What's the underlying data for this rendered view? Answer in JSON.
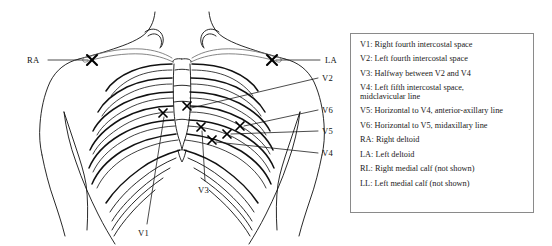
{
  "figure": {
    "kind": "anatomical-diagram",
    "torso": {
      "view": "anterior",
      "features": [
        "neck",
        "shoulders",
        "clavicles",
        "sternum",
        "rib-cage",
        "arms"
      ]
    },
    "electrode_markers": [
      {
        "id": "RA",
        "x": 92,
        "y": 60,
        "label": "RA"
      },
      {
        "id": "LA",
        "x": 272,
        "y": 60,
        "label": "LA"
      },
      {
        "id": "V1",
        "x": 163,
        "y": 113,
        "label": "V1"
      },
      {
        "id": "V2",
        "x": 187,
        "y": 106,
        "label": "V2"
      },
      {
        "id": "V3",
        "x": 201,
        "y": 127,
        "label": "V3"
      },
      {
        "id": "V4",
        "x": 212,
        "y": 140,
        "label": "V4"
      },
      {
        "id": "V5",
        "x": 227,
        "y": 134,
        "label": "V5"
      },
      {
        "id": "V6",
        "x": 240,
        "y": 126,
        "label": "V6"
      }
    ],
    "callouts": [
      {
        "id": "callout-RA",
        "text": "RA",
        "label_x": 27,
        "label_y": 55,
        "line": [
          [
            48,
            60
          ],
          [
            88,
            60
          ]
        ]
      },
      {
        "id": "callout-LA",
        "text": "LA",
        "label_x": 325,
        "label_y": 55,
        "line": [
          [
            276,
            60
          ],
          [
            320,
            60
          ]
        ]
      },
      {
        "id": "callout-V2",
        "text": "V2",
        "label_x": 322,
        "label_y": 73,
        "line": [
          [
            191,
            108
          ],
          [
            318,
            78
          ]
        ]
      },
      {
        "id": "callout-V6",
        "text": "V6",
        "label_x": 322,
        "label_y": 105,
        "line": [
          [
            244,
            126
          ],
          [
            318,
            110
          ]
        ]
      },
      {
        "id": "callout-V5",
        "text": "V5",
        "label_x": 322,
        "label_y": 126,
        "line": [
          [
            231,
            134
          ],
          [
            318,
            131
          ]
        ]
      },
      {
        "id": "callout-V4",
        "text": "V4",
        "label_x": 322,
        "label_y": 148,
        "line": [
          [
            216,
            142
          ],
          [
            318,
            153
          ]
        ]
      },
      {
        "id": "callout-V3",
        "text": "V3",
        "label_x": 198,
        "label_y": 185,
        "line": [
          [
            202,
            131
          ],
          [
            205,
            181
          ]
        ]
      },
      {
        "id": "callout-V1",
        "text": "V1",
        "label_x": 138,
        "label_y": 228,
        "line": [
          [
            164,
            117
          ],
          [
            147,
            224
          ]
        ]
      }
    ]
  },
  "legend": {
    "items": [
      "V1: Right fourth intercostal space",
      "V2: Left fourth intercostal space",
      "V3: Halfway between V2 and V4",
      "V4: Left fifth intercostal space,\n    midclavicular line",
      "V5: Horizontal to V4, anterior-axillary line",
      "V6: Horizontal to V5, midaxillary line",
      "RA: Right deltoid",
      "LA: Left deltoid",
      "RL: Right medial calf (not shown)",
      "LL: Left medial calf (not shown)"
    ]
  },
  "colors": {
    "ink": "#111111",
    "legend_border": "#8a8a8a",
    "background": "#ffffff",
    "bone_light": "#6f6f6f"
  }
}
